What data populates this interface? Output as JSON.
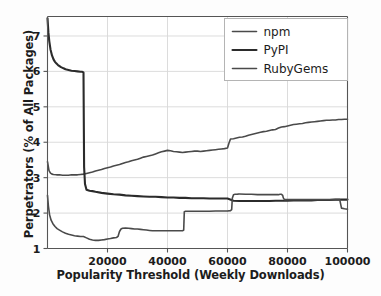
{
  "chart_data": {
    "type": "line",
    "title": "",
    "xlabel": "Popularity Threshold (Weekly Downloads)",
    "ylabel": "Perpetrators (% of All Packages)",
    "xlim": [
      0,
      100000
    ],
    "ylim": [
      1,
      7.55
    ],
    "grid": true,
    "legend_position": "top-right",
    "xticks": [
      20000,
      40000,
      60000,
      80000,
      100000
    ],
    "xtick_labels": [
      "20000",
      "40000",
      "60000",
      "80000",
      "100000"
    ],
    "yticks": [
      1,
      2,
      3,
      4,
      5,
      6,
      7
    ],
    "ytick_labels": [
      "1",
      "2",
      "3",
      "4",
      "5",
      "6",
      "7"
    ],
    "series": [
      {
        "name": "npm",
        "color": "#4a4a4a",
        "width": 1.6,
        "x": [
          0,
          500,
          1000,
          1500,
          2000,
          3000,
          4000,
          5000,
          6000,
          7000,
          8000,
          9000,
          10000,
          11000,
          12000,
          13000,
          14000,
          15000,
          16000,
          17000,
          18000,
          19000,
          20000,
          21000,
          22000,
          23000,
          24000,
          25000,
          26000,
          27000,
          28000,
          29000,
          30000,
          31000,
          32000,
          33000,
          34000,
          35000,
          36000,
          37000,
          38000,
          39000,
          40000,
          41000,
          42000,
          43000,
          44000,
          45000,
          46000,
          47000,
          48000,
          49000,
          50000,
          51000,
          52000,
          53000,
          54000,
          55000,
          56000,
          57000,
          58000,
          59000,
          60000,
          60500,
          61000,
          62000,
          63000,
          64000,
          65000,
          66000,
          67000,
          68000,
          69000,
          70000,
          71000,
          72000,
          73000,
          74000,
          75000,
          76000,
          77000,
          78000,
          79000,
          80000,
          81000,
          82000,
          83000,
          84000,
          85000,
          86000,
          87000,
          88000,
          89000,
          90000,
          91000,
          92000,
          93000,
          94000,
          95000,
          96000,
          97000,
          98000,
          99000,
          100000
        ],
        "y": [
          3.45,
          3.2,
          3.13,
          3.1,
          3.09,
          3.08,
          3.08,
          3.07,
          3.07,
          3.07,
          3.08,
          3.08,
          3.08,
          3.09,
          3.1,
          3.12,
          3.14,
          3.16,
          3.19,
          3.21,
          3.23,
          3.26,
          3.28,
          3.3,
          3.33,
          3.35,
          3.37,
          3.4,
          3.43,
          3.45,
          3.48,
          3.5,
          3.52,
          3.55,
          3.58,
          3.6,
          3.62,
          3.64,
          3.67,
          3.7,
          3.73,
          3.75,
          3.77,
          3.76,
          3.74,
          3.73,
          3.72,
          3.71,
          3.72,
          3.73,
          3.74,
          3.75,
          3.75,
          3.74,
          3.75,
          3.76,
          3.77,
          3.78,
          3.79,
          3.8,
          3.81,
          3.82,
          3.84,
          3.98,
          4.09,
          4.1,
          4.12,
          4.14,
          4.15,
          4.17,
          4.2,
          4.22,
          4.24,
          4.26,
          4.28,
          4.3,
          4.31,
          4.33,
          4.35,
          4.36,
          4.4,
          4.43,
          4.44,
          4.46,
          4.48,
          4.5,
          4.51,
          4.52,
          4.53,
          4.55,
          4.56,
          4.57,
          4.58,
          4.59,
          4.6,
          4.61,
          4.62,
          4.62,
          4.63,
          4.63,
          4.64,
          4.64,
          4.65,
          4.65
        ]
      },
      {
        "name": "PyPI",
        "color": "#2b2b2b",
        "width": 2.1,
        "x": [
          0,
          300,
          600,
          1000,
          1500,
          2000,
          2500,
          3000,
          3500,
          4000,
          4500,
          5000,
          5500,
          6000,
          7000,
          8000,
          9000,
          10000,
          11000,
          11500,
          11800,
          12000,
          12100,
          12200,
          12500,
          13000,
          14000,
          15000,
          16000,
          18000,
          20000,
          22000,
          24000,
          26000,
          28000,
          30000,
          32000,
          34000,
          36000,
          38000,
          40000,
          42000,
          44000,
          46000,
          48000,
          50000,
          52000,
          54000,
          56000,
          58000,
          60000,
          62000,
          64000,
          66000,
          68000,
          70000,
          72000,
          74000,
          76000,
          78000,
          80000,
          82000,
          84000,
          86000,
          88000,
          90000,
          92000,
          94000,
          96000,
          98000,
          100000
        ],
        "y": [
          7.5,
          7.1,
          6.85,
          6.62,
          6.45,
          6.34,
          6.27,
          6.22,
          6.18,
          6.15,
          6.12,
          6.1,
          6.08,
          6.06,
          6.04,
          6.02,
          6.01,
          6.0,
          5.99,
          5.99,
          5.98,
          5.97,
          4.6,
          3.3,
          2.82,
          2.66,
          2.63,
          2.62,
          2.6,
          2.57,
          2.55,
          2.53,
          2.52,
          2.5,
          2.49,
          2.48,
          2.47,
          2.46,
          2.46,
          2.45,
          2.44,
          2.44,
          2.43,
          2.43,
          2.42,
          2.42,
          2.42,
          2.41,
          2.41,
          2.41,
          2.41,
          2.35,
          2.34,
          2.34,
          2.34,
          2.34,
          2.34,
          2.34,
          2.35,
          2.35,
          2.35,
          2.36,
          2.36,
          2.36,
          2.36,
          2.37,
          2.37,
          2.37,
          2.38,
          2.38,
          2.38
        ]
      },
      {
        "name": "RubyGems",
        "color": "#4a4a4a",
        "width": 1.6,
        "x": [
          0,
          300,
          700,
          1200,
          1800,
          2500,
          3200,
          4000,
          5000,
          6000,
          7000,
          8000,
          9000,
          10000,
          11000,
          12000,
          13000,
          14000,
          15000,
          16000,
          17000,
          18000,
          19000,
          20000,
          21000,
          22000,
          23000,
          23500,
          24000,
          24500,
          25000,
          26000,
          27000,
          28000,
          29000,
          30000,
          31000,
          32000,
          33000,
          34000,
          35000,
          36000,
          38000,
          40000,
          42000,
          44000,
          45000,
          45400,
          45600,
          46000,
          48000,
          50000,
          52000,
          54000,
          56000,
          58000,
          60000,
          61000,
          61400,
          61600,
          62000,
          62500,
          63000,
          63400,
          63600,
          64000,
          66000,
          68000,
          70000,
          72000,
          74000,
          75000,
          76000,
          77000,
          77500,
          78000,
          78400,
          78600,
          79000,
          82000,
          85000,
          88000,
          91000,
          94000,
          96000,
          97000,
          97400,
          97600,
          98000,
          99000,
          100000
        ],
        "y": [
          2.5,
          2.2,
          1.95,
          1.8,
          1.7,
          1.62,
          1.56,
          1.52,
          1.47,
          1.43,
          1.4,
          1.38,
          1.36,
          1.35,
          1.34,
          1.34,
          1.3,
          1.26,
          1.24,
          1.23,
          1.23,
          1.24,
          1.25,
          1.27,
          1.28,
          1.3,
          1.31,
          1.34,
          1.48,
          1.55,
          1.57,
          1.58,
          1.57,
          1.56,
          1.55,
          1.55,
          1.54,
          1.53,
          1.52,
          1.51,
          1.5,
          1.5,
          1.5,
          1.5,
          1.5,
          1.5,
          1.5,
          1.52,
          2.04,
          2.05,
          2.05,
          2.05,
          2.05,
          2.05,
          2.06,
          2.06,
          2.06,
          2.07,
          2.1,
          2.42,
          2.52,
          2.53,
          2.53,
          2.53,
          2.54,
          2.54,
          2.53,
          2.53,
          2.52,
          2.52,
          2.52,
          2.52,
          2.52,
          2.52,
          2.53,
          2.53,
          2.5,
          2.43,
          2.38,
          2.38,
          2.38,
          2.38,
          2.38,
          2.38,
          2.38,
          2.38,
          2.38,
          2.3,
          2.14,
          2.12,
          2.11
        ]
      }
    ],
    "legend_entries": [
      {
        "label": "npm",
        "color": "#4a4a4a"
      },
      {
        "label": "PyPI",
        "color": "#2b2b2b"
      },
      {
        "label": "RubyGems",
        "color": "#4a4a4a"
      }
    ]
  },
  "style": {
    "background": "#fdfdfd",
    "plot_background": "#ffffff",
    "grid_color": "#d8d8d8",
    "axis_color": "#555555",
    "text_color": "#1c1c1c"
  }
}
